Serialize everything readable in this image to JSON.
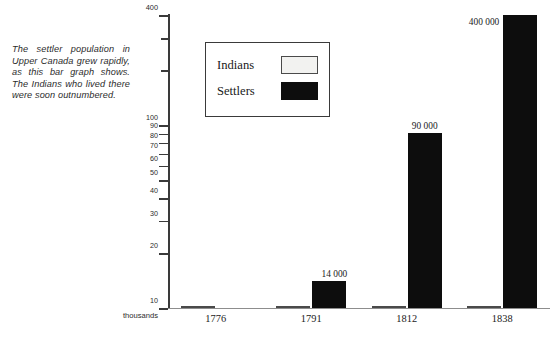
{
  "caption": "The settler population in Upper Canada grew rapidly, as this bar graph shows. The Indians who lived there were soon outnumbered.",
  "legend": {
    "items": [
      {
        "label": "Indians",
        "swatch": "light"
      },
      {
        "label": "Settlers",
        "swatch": "dark"
      }
    ]
  },
  "chart_data": {
    "type": "bar",
    "title": "",
    "xlabel": "",
    "ylabel": "thousands",
    "unit_label": "thousands",
    "scale": "log",
    "ylim": [
      10,
      400
    ],
    "grid": false,
    "legend_position": "upper-left-inset",
    "categories": [
      "1776",
      "1791",
      "1812",
      "1838"
    ],
    "tick_labels": [
      "400",
      "100",
      "90",
      "80",
      "70",
      "60",
      "50",
      "40",
      "30",
      "20",
      "10"
    ],
    "tick_values": [
      400,
      100,
      90,
      80,
      70,
      60,
      50,
      40,
      30,
      20,
      10
    ],
    "series": [
      {
        "name": "Indians",
        "color": "#f2f2f0",
        "values": [
          10,
          10,
          10,
          10
        ],
        "labels": [
          "",
          "",
          "",
          ""
        ]
      },
      {
        "name": "Settlers",
        "color": "#0d0d0d",
        "values": [
          0,
          14,
          90,
          400
        ],
        "labels": [
          "",
          "14 000",
          "90 000",
          "400 000"
        ]
      }
    ],
    "annotations": [
      "14 000",
      "90 000",
      "400 000"
    ]
  }
}
